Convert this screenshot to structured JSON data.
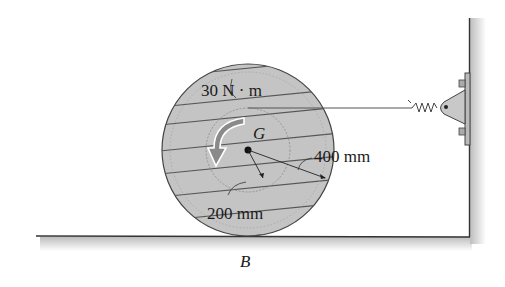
{
  "figure": {
    "labels": {
      "moment": "30 N · m",
      "center": "G",
      "outer_radius": "400 mm",
      "inner_radius": "200 mm",
      "contact_point": "B"
    },
    "colors": {
      "disk_fill": "#c4c4c4",
      "line": "#333333",
      "arrow_fill": "#8a8a8a",
      "shadow": "#cfcfcf"
    }
  }
}
